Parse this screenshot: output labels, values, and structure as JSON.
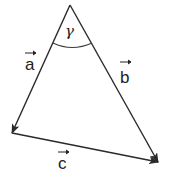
{
  "diagram": {
    "vertices": {
      "apex": [
        70,
        5
      ],
      "bottom_left": [
        12,
        133
      ],
      "bottom_right": [
        158,
        162
      ]
    },
    "vectors": [
      {
        "name": "a",
        "label": "a",
        "from": "apex",
        "to": "bottom_left"
      },
      {
        "name": "b",
        "label": "b",
        "from": "apex",
        "to": "bottom_right"
      },
      {
        "name": "c",
        "label": "c",
        "from": "bottom_left",
        "to": "bottom_right"
      }
    ],
    "angle": {
      "label": "γ",
      "at": "apex"
    },
    "colors": {
      "stroke": "#2a2a2a",
      "background": "#ffffff"
    }
  }
}
